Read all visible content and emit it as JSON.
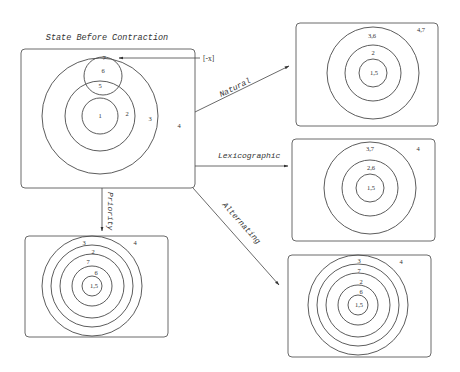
{
  "title": "State Before Contraction",
  "negation_label": "[-x]",
  "edges": [
    {
      "id": "natural",
      "label": "Natural"
    },
    {
      "id": "lexicographic",
      "label": "Lexicographic"
    },
    {
      "id": "priority",
      "label": "Priority"
    },
    {
      "id": "alternating",
      "label": "Alternating"
    }
  ],
  "panels": {
    "before": {
      "rings": [
        "1",
        "2",
        "3"
      ],
      "outside": "4",
      "small_circle": [
        "7",
        "6",
        "5"
      ]
    },
    "natural": {
      "rings": [
        "1,5",
        "2",
        "3,6"
      ],
      "outside": "4,7"
    },
    "lexicographic": {
      "rings": [
        "1,5",
        "2,6",
        "3,7"
      ],
      "outside": "4"
    },
    "priority": {
      "rings": [
        "1,5",
        "6",
        "7",
        "2",
        "3"
      ],
      "outside": "4"
    },
    "alternating": {
      "rings": [
        "1,5",
        "6",
        "2",
        "7",
        "3"
      ],
      "outside": "4"
    }
  }
}
